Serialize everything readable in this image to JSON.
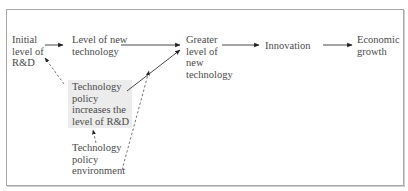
{
  "diagram": {
    "type": "flowchart",
    "nodes": {
      "initial_rd": {
        "lines": [
          "Initial",
          "level of",
          "R&D"
        ]
      },
      "new_tech": {
        "lines": [
          "Level of new",
          "technology"
        ]
      },
      "greater_tech": {
        "lines": [
          "Greater",
          "level of",
          "new",
          "technology"
        ]
      },
      "innovation": {
        "lines": [
          "Innovation"
        ]
      },
      "growth": {
        "lines": [
          "Economic",
          "growth"
        ]
      },
      "policy": {
        "lines": [
          "Technology",
          "policy",
          "increases the",
          "level of R&D"
        ],
        "fill": "#ececec"
      },
      "environment": {
        "lines": [
          "Technology",
          "policy",
          "environment"
        ]
      }
    },
    "edges": [
      {
        "from": "initial_rd",
        "to": "new_tech",
        "style": "solid"
      },
      {
        "from": "new_tech",
        "to": "greater_tech",
        "style": "solid"
      },
      {
        "from": "policy",
        "to": "greater_tech",
        "style": "solid"
      },
      {
        "from": "greater_tech",
        "to": "innovation",
        "style": "solid"
      },
      {
        "from": "innovation",
        "to": "growth",
        "style": "solid"
      },
      {
        "from": "policy",
        "to": "initial_rd",
        "style": "dashed"
      },
      {
        "from": "environment",
        "to": "policy",
        "style": "dashed"
      },
      {
        "from": "environment",
        "to": "greater_tech",
        "style": "dashed"
      }
    ],
    "colors": {
      "line": "#333333",
      "text": "#4a4a4a",
      "frame": "#a8a8a8",
      "policy_fill": "#ececec"
    }
  }
}
